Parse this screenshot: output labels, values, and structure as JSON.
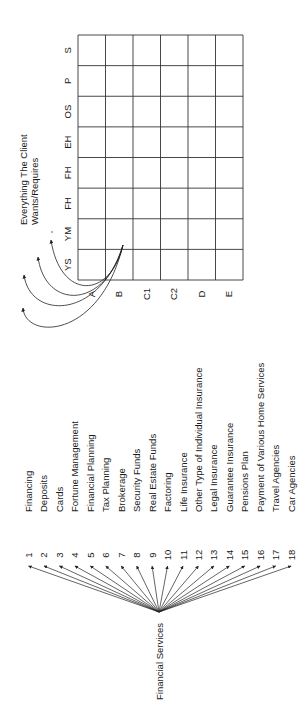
{
  "diagram": {
    "orientation": "rotated-90-ccw",
    "client_wants": {
      "title_line1": "Everything The Client",
      "title_line2": "Wants/Requires",
      "row_labels": [
        "S",
        "P",
        "OS",
        "EH",
        "FH",
        "FH",
        "YM",
        "YS"
      ],
      "column_labels": [
        "A",
        "B",
        "C1",
        "C2",
        "D",
        "E"
      ],
      "curved_arrow_count": 4
    },
    "financial_services": {
      "root_label": "Financial Services",
      "items": [
        {
          "number": "1",
          "label": "Financing"
        },
        {
          "number": "2",
          "label": "Deposits"
        },
        {
          "number": "3",
          "label": "Cards"
        },
        {
          "number": "4",
          "label": "Fortune Management"
        },
        {
          "number": "5",
          "label": "Financial Planning"
        },
        {
          "number": "6",
          "label": "Tax Planning"
        },
        {
          "number": "7",
          "label": "Brokerage"
        },
        {
          "number": "8",
          "label": "Security Funds"
        },
        {
          "number": "9",
          "label": "Real Estate Funds"
        },
        {
          "number": "10",
          "label": "Factoring"
        },
        {
          "number": "11",
          "label": "Life Insurance"
        },
        {
          "number": "12",
          "label": "Other Type of Individual Insurance"
        },
        {
          "number": "13",
          "label": "Legal Insurance"
        },
        {
          "number": "14",
          "label": "Guarantee Insurance"
        },
        {
          "number": "15",
          "label": "Pensions Plan"
        },
        {
          "number": "16",
          "label": "Payment of Various Home Services"
        },
        {
          "number": "17",
          "label": "Travel Agencies"
        },
        {
          "number": "18",
          "label": "Car Agencies"
        }
      ]
    },
    "colors": {
      "line": "#222222",
      "text": "#1a1a1a",
      "background": "#ffffff"
    }
  }
}
